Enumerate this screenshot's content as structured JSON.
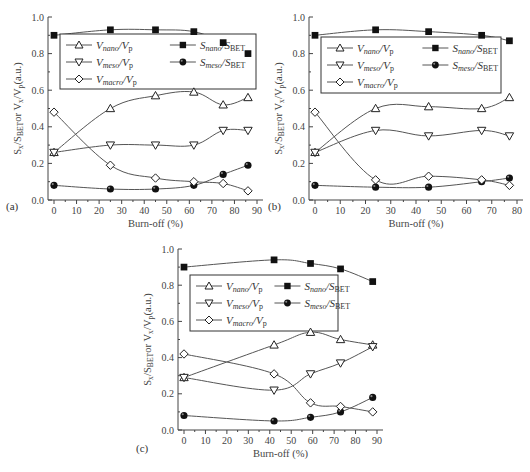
{
  "figure": {
    "common": {
      "xlabel": "Burn-off (%)",
      "ylabel": "S_x/S_BET or V_x/V_p (a.u.)",
      "ylim": [
        0.0,
        1.0
      ],
      "yticks": [
        0.0,
        0.2,
        0.4,
        0.6,
        0.8,
        1.0
      ],
      "ytick_labels": [
        "0.0",
        "0.2",
        "0.4",
        "0.6",
        "0.8",
        "1.0"
      ]
    },
    "legend": [
      {
        "key": "V_nano_Vp",
        "main": "V",
        "sub": "nano",
        "den": "V",
        "densub": "p",
        "marker": "triangle-up-open"
      },
      {
        "key": "S_nano_SBET",
        "main": "S",
        "sub": "nano",
        "den": "S",
        "densub": "BET",
        "marker": "square-filled"
      },
      {
        "key": "V_meso_Vp",
        "main": "V",
        "sub": "meso",
        "den": "V",
        "densub": "p",
        "marker": "triangle-down-open"
      },
      {
        "key": "S_meso_SBET",
        "main": "S",
        "sub": "meso",
        "den": "S",
        "densub": "BET",
        "marker": "circle-filled"
      },
      {
        "key": "V_macro_Vp",
        "main": "V",
        "sub": "macro",
        "den": "V",
        "densub": "p",
        "marker": "diamond-open"
      }
    ]
  },
  "chart_data": [
    {
      "panel": "(a)",
      "type": "line",
      "title": "",
      "xlabel": "Burn-off (%)",
      "ylabel": "S_x/S_BET or V_x/V_p (a.u.)",
      "xlim": [
        0,
        90
      ],
      "ylim": [
        0.0,
        1.0
      ],
      "xticks": [
        0,
        10,
        20,
        30,
        40,
        50,
        60,
        70,
        80,
        90
      ],
      "x": [
        0,
        25,
        45,
        62,
        75,
        86
      ],
      "series": [
        {
          "name": "V_nano/V_p",
          "marker": "triangle-up-open",
          "values": [
            0.26,
            0.5,
            0.57,
            0.59,
            0.52,
            0.56
          ]
        },
        {
          "name": "S_nano/S_BET",
          "marker": "square-filled",
          "values": [
            0.9,
            0.93,
            0.93,
            0.92,
            0.86,
            0.8
          ]
        },
        {
          "name": "V_meso/V_p",
          "marker": "triangle-down-open",
          "values": [
            0.26,
            0.3,
            0.3,
            0.3,
            0.38,
            0.38
          ]
        },
        {
          "name": "S_meso/S_BET",
          "marker": "circle-filled",
          "values": [
            0.08,
            0.06,
            0.06,
            0.08,
            0.14,
            0.19
          ]
        },
        {
          "name": "V_macro/V_p",
          "marker": "diamond-open",
          "values": [
            0.48,
            0.19,
            0.12,
            0.1,
            0.09,
            0.05
          ]
        }
      ],
      "legend_position": "upper-center-inset",
      "grid": false
    },
    {
      "panel": "(b)",
      "type": "line",
      "title": "",
      "xlabel": "Burn-off (%)",
      "ylabel": "S_x/S_BET or V_x/V_p (a.u.)",
      "xlim": [
        0,
        80
      ],
      "ylim": [
        0.0,
        1.0
      ],
      "xticks": [
        0,
        10,
        20,
        30,
        40,
        50,
        60,
        70,
        80
      ],
      "x": [
        0,
        24,
        45,
        66,
        77
      ],
      "series": [
        {
          "name": "V_nano/V_p",
          "marker": "triangle-up-open",
          "values": [
            0.26,
            0.5,
            0.51,
            0.5,
            0.56
          ]
        },
        {
          "name": "S_nano/S_BET",
          "marker": "square-filled",
          "values": [
            0.9,
            0.93,
            0.92,
            0.9,
            0.87
          ]
        },
        {
          "name": "V_meso/V_p",
          "marker": "triangle-down-open",
          "values": [
            0.26,
            0.38,
            0.35,
            0.38,
            0.35
          ]
        },
        {
          "name": "S_meso/S_BET",
          "marker": "circle-filled",
          "values": [
            0.08,
            0.07,
            0.07,
            0.1,
            0.12
          ]
        },
        {
          "name": "V_macro/V_p",
          "marker": "diamond-open",
          "values": [
            0.48,
            0.11,
            0.13,
            0.11,
            0.08
          ]
        }
      ],
      "legend_position": "upper-center-inset",
      "grid": false
    },
    {
      "panel": "(c)",
      "type": "line",
      "title": "",
      "xlabel": "Burn-off (%)",
      "ylabel": "S_x/S_BET or V_x/V_p (a.u.)",
      "xlim": [
        0,
        90
      ],
      "ylim": [
        0.0,
        1.0
      ],
      "xticks": [
        0,
        10,
        20,
        30,
        40,
        50,
        60,
        70,
        80,
        90
      ],
      "x": [
        0,
        42,
        59,
        73,
        88
      ],
      "series": [
        {
          "name": "V_nano/V_p",
          "marker": "triangle-up-open",
          "values": [
            0.29,
            0.47,
            0.54,
            0.5,
            0.47
          ]
        },
        {
          "name": "S_nano/S_BET",
          "marker": "square-filled",
          "values": [
            0.9,
            0.94,
            0.92,
            0.89,
            0.82
          ]
        },
        {
          "name": "V_meso/V_p",
          "marker": "triangle-down-open",
          "values": [
            0.29,
            0.22,
            0.31,
            0.37,
            0.46
          ]
        },
        {
          "name": "S_meso/S_BET",
          "marker": "circle-filled",
          "values": [
            0.08,
            0.05,
            0.07,
            0.1,
            0.18
          ]
        },
        {
          "name": "V_macro/V_p",
          "marker": "diamond-open",
          "values": [
            0.42,
            0.31,
            0.15,
            0.13,
            0.1
          ]
        }
      ],
      "legend_position": "upper-center-inset",
      "grid": false
    }
  ],
  "layout": {
    "panels": [
      {
        "x0": 54,
        "x1": 257,
        "y0": 200,
        "y1": 17,
        "axisX": 48,
        "legend": {
          "x": 60,
          "y": 34,
          "w": 196,
          "h": 55
        },
        "labelX": 6,
        "labelY": 210
      },
      {
        "x0": 315,
        "x1": 517,
        "y0": 200,
        "y1": 17,
        "axisX": 309,
        "legend": {
          "x": 321,
          "y": 37,
          "w": 180,
          "h": 56
        },
        "labelX": 268,
        "labelY": 210
      },
      {
        "x0": 184,
        "x1": 377,
        "y0": 430,
        "y1": 249,
        "axisX": 178,
        "legend": {
          "x": 190,
          "y": 275,
          "w": 148,
          "h": 56
        },
        "labelX": 136,
        "labelY": 452
      }
    ]
  }
}
